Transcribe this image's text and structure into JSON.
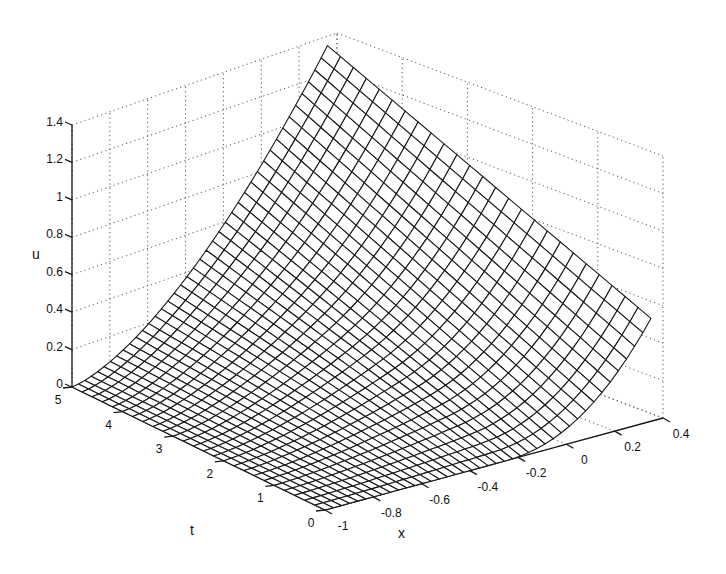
{
  "chart_data": {
    "type": "surface",
    "style": "mesh",
    "title": "",
    "xlabel": "x",
    "ylabel": "t",
    "zlabel": "u",
    "xlim": [
      -1,
      0.4
    ],
    "ylim": [
      0,
      5
    ],
    "zlim": [
      0,
      1.4
    ],
    "x_ticks": [
      "-1",
      "-0.8",
      "-0.6",
      "-0.4",
      "-0.2",
      "0",
      "0.2",
      "0.4"
    ],
    "x_tick_values": [
      -1,
      -0.8,
      -0.6,
      -0.4,
      -0.2,
      0,
      0.2,
      0.4
    ],
    "t_ticks": [
      "0",
      "1",
      "2",
      "3",
      "4",
      "5"
    ],
    "t_tick_values": [
      0,
      1,
      2,
      3,
      4,
      5
    ],
    "u_ticks": [
      "0",
      "0.2",
      "0.4",
      "0.6",
      "0.8",
      "1",
      "1.2",
      "1.4"
    ],
    "u_tick_values": [
      0,
      0.2,
      0.4,
      0.6,
      0.8,
      1,
      1.2,
      1.4
    ],
    "grid": true,
    "mesh": {
      "x_range": [
        -1,
        0.35
      ],
      "t_range": [
        0,
        5
      ],
      "x_count": 41,
      "t_count": 26,
      "corner_values": {
        "x_min_t_0": 0.0,
        "x_min_t_5": 0.0,
        "x_max_t_0": 0.55,
        "x_max_t_5": 1.35
      }
    },
    "colors": {
      "mesh": "#1a1a1a",
      "grid": "#555555",
      "axis": "#1a1a1a",
      "background": "#ffffff"
    }
  }
}
